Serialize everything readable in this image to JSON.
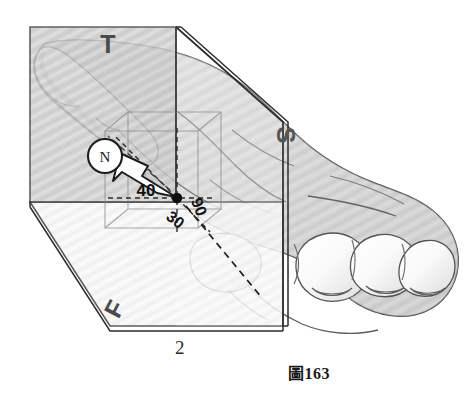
{
  "figure": {
    "caption": "圖163",
    "plane_number_label": "2",
    "plane_labels": {
      "transverse": "T",
      "sagittal": "S",
      "frontal": "F"
    },
    "compass_label": "N",
    "angle_labels": {
      "left": "40",
      "lower_left": "30",
      "right": "90"
    },
    "colors": {
      "transverse_plane_fill": "#c9c9c9",
      "frontal_plane_fill": "#f2f2f2",
      "sagittal_plane_fill": "#fbfbfb",
      "outline": "#333333",
      "foot_fill": "#d2d2d2",
      "foot_highlight": "#fdfdfd",
      "label_text": "#3a3a3a",
      "caption_text": "#1a1a1a",
      "arrow_fill": "#ffffff",
      "pivot_dot": "#101010"
    }
  }
}
